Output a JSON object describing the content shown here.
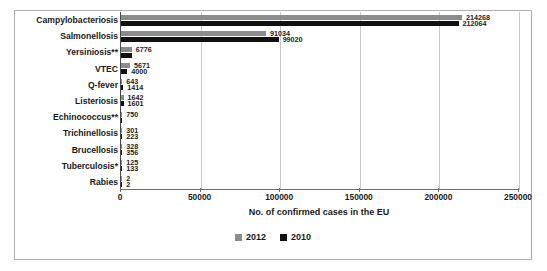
{
  "chart_data": {
    "type": "bar",
    "orientation": "horizontal",
    "title": "",
    "xlabel": "No. of confirmed cases in the EU",
    "ylabel": "",
    "xlim": [
      0,
      250000
    ],
    "xticks": [
      0,
      50000,
      100000,
      150000,
      200000,
      250000
    ],
    "xtick_labels": [
      "0",
      "50000",
      "100000",
      "150000",
      "200000",
      "250000"
    ],
    "grid": true,
    "grid_axis": "x",
    "legend_position": "bottom",
    "categories": [
      "Campylobacteriosis",
      "Salmonellosis",
      "Yersiniosis**",
      "VTEC",
      "Q-fever",
      "Listeriosis",
      "Echinococcus**",
      "Trichinellosis",
      "Brucellosis",
      "Tuberculosis*",
      "Rabies"
    ],
    "series": [
      {
        "name": "2012",
        "color": "#8c8c8c",
        "values": [
          214268,
          91034,
          6776,
          5671,
          643,
          1642,
          750,
          301,
          328,
          125,
          2
        ]
      },
      {
        "name": "2010",
        "color": "#111111",
        "values": [
          212064,
          99020,
          6776,
          4000,
          1414,
          1601,
          750,
          223,
          356,
          133,
          2
        ]
      }
    ],
    "bar_labels": [
      {
        "category": "Campylobacteriosis",
        "y2012": "214268",
        "y2010": "212064"
      },
      {
        "category": "Salmonellosis",
        "y2012": "91034",
        "y2010": "99020"
      },
      {
        "category": "Yersiniosis**",
        "y2012": "6776",
        "y2010": ""
      },
      {
        "category": "VTEC",
        "y2012": "5671",
        "y2010": "4000"
      },
      {
        "category": "Q-fever",
        "y2012": "643",
        "y2010": "1414"
      },
      {
        "category": "Listeriosis",
        "y2012": "1642",
        "y2010": "1601"
      },
      {
        "category": "Echinococcus**",
        "y2012": "750",
        "y2010": ""
      },
      {
        "category": "Trichinellosis",
        "y2012": "301",
        "y2010": "223"
      },
      {
        "category": "Brucellosis",
        "y2012": "328",
        "y2010": "356"
      },
      {
        "category": "Tuberculosis*",
        "y2012": "125",
        "y2010": "133"
      },
      {
        "category": "Rabies",
        "y2012": "2",
        "y2010": "2"
      }
    ],
    "legend": [
      {
        "label": "2012",
        "color": "#8c8c8c"
      },
      {
        "label": "2010",
        "color": "#111111"
      }
    ]
  }
}
